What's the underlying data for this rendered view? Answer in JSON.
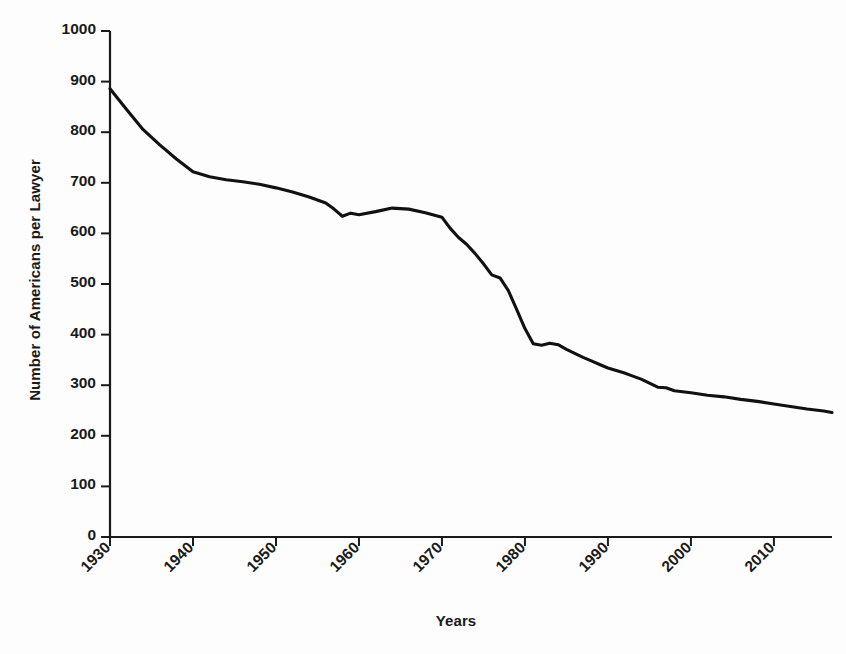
{
  "chart_data": {
    "type": "line",
    "title": "",
    "xlabel": "Years",
    "ylabel": "Number of Americans per Lawyer",
    "xlim": [
      1930,
      2017
    ],
    "ylim": [
      0,
      1000
    ],
    "grid": false,
    "legend": null,
    "line_color": "#111111",
    "background_color": "#fdfdfd",
    "xticks": [
      1930,
      1940,
      1950,
      1960,
      1970,
      1980,
      1990,
      2000,
      2010
    ],
    "xtick_labels": [
      "1930",
      "1940",
      "1950",
      "1960",
      "1970",
      "1980",
      "1990",
      "2000",
      "2010"
    ],
    "yticks": [
      0,
      100,
      200,
      300,
      400,
      500,
      600,
      700,
      800,
      900,
      1000
    ],
    "ytick_labels": [
      "0",
      "100",
      "200",
      "300",
      "400",
      "500",
      "600",
      "700",
      "800",
      "900",
      "1000"
    ],
    "series": [
      {
        "name": "Americans per Lawyer",
        "x": [
          1930,
          1932,
          1934,
          1936,
          1938,
          1940,
          1942,
          1944,
          1946,
          1948,
          1950,
          1952,
          1954,
          1956,
          1957,
          1958,
          1959,
          1960,
          1962,
          1964,
          1966,
          1968,
          1970,
          1971,
          1972,
          1973,
          1974,
          1975,
          1976,
          1977,
          1978,
          1979,
          1980,
          1981,
          1982,
          1983,
          1984,
          1985,
          1986,
          1987,
          1988,
          1989,
          1990,
          1991,
          1992,
          1993,
          1994,
          1995,
          1996,
          1997,
          1998,
          2000,
          2002,
          2004,
          2006,
          2008,
          2010,
          2012,
          2014,
          2016,
          2017
        ],
        "values": [
          886,
          845,
          805,
          775,
          747,
          722,
          712,
          706,
          702,
          697,
          690,
          682,
          672,
          660,
          648,
          634,
          640,
          637,
          643,
          650,
          648,
          641,
          632,
          610,
          592,
          578,
          560,
          540,
          518,
          512,
          487,
          450,
          412,
          382,
          379,
          383,
          380,
          371,
          363,
          355,
          348,
          341,
          334,
          329,
          324,
          318,
          312,
          304,
          296,
          295,
          289,
          285,
          280,
          277,
          272,
          268,
          263,
          258,
          253,
          249,
          246
        ]
      }
    ]
  },
  "axis_titles": {
    "y": "Number of Americans per Lawyer",
    "x": "Years"
  }
}
